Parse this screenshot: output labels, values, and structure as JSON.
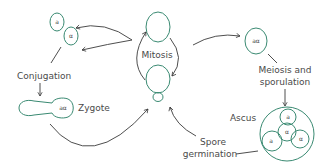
{
  "diagram": {
    "labels": {
      "mitosis": "Mitosis",
      "conjugation": "Conjugation",
      "zygote": "Zygote",
      "meiosis_line1": "Meiosis and",
      "meiosis_line2": "sporulation",
      "ascus": "Ascus",
      "spore_line1": "Spore",
      "spore_line2": "germination"
    },
    "symbols": {
      "haploid_a": "a",
      "haploid_alpha": "α",
      "diploid": "aα",
      "spore_a1": "a",
      "spore_a2": "a",
      "spore_alpha1": "α",
      "spore_alpha2": "α"
    },
    "colors": {
      "cell_stroke": "#3a8a72",
      "arrow_stroke": "#3a3a3a",
      "text": "#4a4a4a"
    }
  }
}
